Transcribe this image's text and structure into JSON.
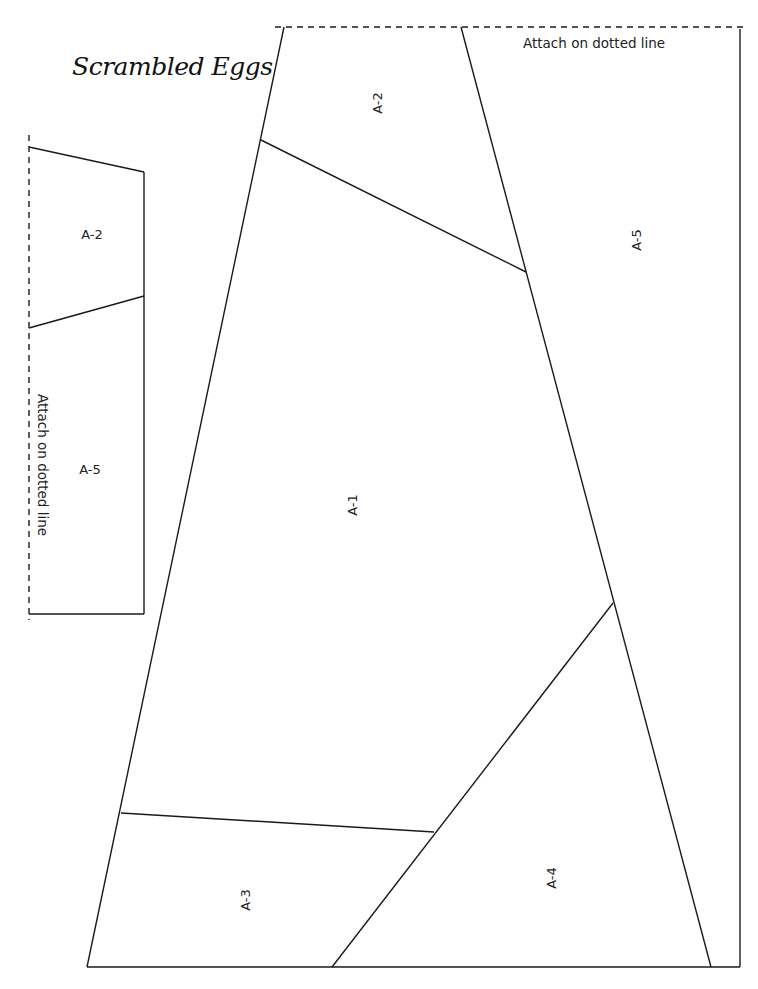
{
  "document": {
    "title": "Scrambled Eggs",
    "attach_top": "Attach on dotted line",
    "attach_side": "Attach on dotted line"
  },
  "small_piece": {
    "sections": [
      {
        "label": "A-2"
      },
      {
        "label": "A-5"
      }
    ]
  },
  "large_piece": {
    "sections": [
      {
        "label": "A-2"
      },
      {
        "label": "A-5"
      },
      {
        "label": "A-1"
      },
      {
        "label": "A-3"
      },
      {
        "label": "A-4"
      }
    ]
  },
  "colors": {
    "line": "#1a1a1a",
    "background": "#ffffff"
  }
}
